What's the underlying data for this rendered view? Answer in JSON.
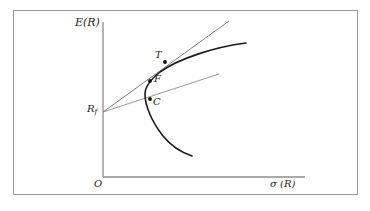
{
  "figure": {
    "type": "economics-diagram",
    "background_color": "#ffffff",
    "frame_color": "#9a9a9a"
  },
  "axes": {
    "y_label": "E(R)",
    "x_label": "σ (R)",
    "origin_label": "O",
    "axis_color": "#8c8c8c",
    "origin_x": 103,
    "origin_y": 177,
    "y_top": 22,
    "x_right": 305
  },
  "points": [
    {
      "id": "T",
      "label": "T",
      "x": 165,
      "y": 62,
      "desc": "tangency-portfolio"
    },
    {
      "id": "F",
      "label": "F",
      "x": 150,
      "y": 81,
      "desc": "frontier-portfolio"
    },
    {
      "id": "C",
      "label": "C",
      "x": 150,
      "y": 99,
      "desc": "constrained-portfolio"
    }
  ],
  "risk_free": {
    "label_main": "R",
    "label_sub": "f",
    "x": 103,
    "y": 112
  },
  "curve": {
    "name": "minimum-variance-frontier",
    "color": "#1a1a1a",
    "stroke_width": 1.6,
    "upper_end_x": 246,
    "upper_end_y": 43,
    "lower_end_x": 192,
    "lower_end_y": 156,
    "vertex_x": 146,
    "vertex_y": 92
  },
  "lines": [
    {
      "name": "capital-market-line-tangent",
      "color": "#6e6e6e",
      "from_x": 103,
      "from_y": 112,
      "to_x": 229,
      "to_y": 21
    },
    {
      "name": "capital-allocation-line-lower",
      "color": "#8a8a8a",
      "from_x": 103,
      "from_y": 112,
      "to_x": 219,
      "to_y": 74
    }
  ]
}
